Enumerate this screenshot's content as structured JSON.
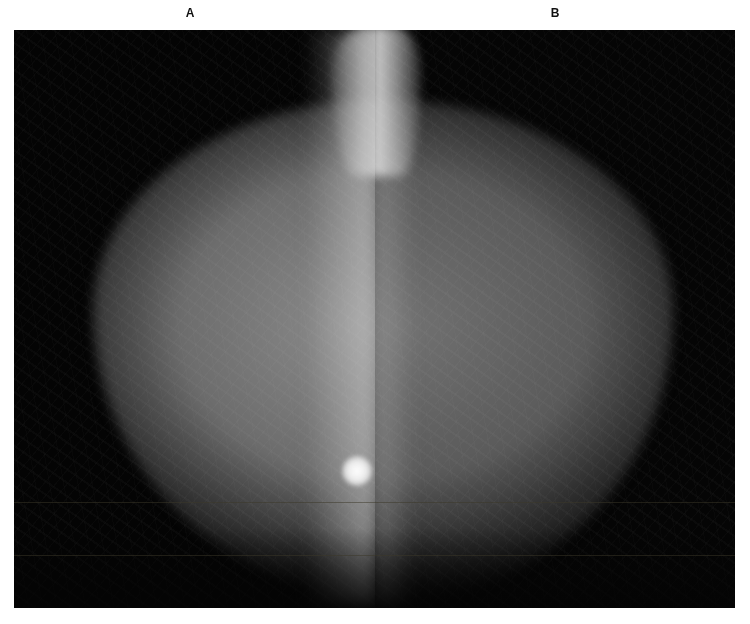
{
  "figure": {
    "panels": [
      {
        "label": "A",
        "description": "Mammogram, left panel, with bright round mass near chest wall (lower right)"
      },
      {
        "label": "B",
        "description": "Mammogram, right panel, mirrored view"
      }
    ]
  },
  "colors": {
    "background": "#ffffff",
    "film": "#030303",
    "label": "#111111"
  }
}
